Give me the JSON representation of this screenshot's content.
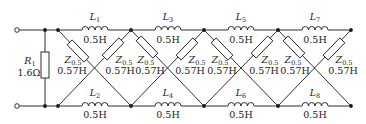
{
  "diagram": {
    "type": "ladder-lattice-circuit",
    "resistor": {
      "name": "R",
      "sub": "1",
      "value": "1.6Ω"
    },
    "inductors": [
      {
        "name": "L",
        "sub": "1",
        "value": "0.5H"
      },
      {
        "name": "L",
        "sub": "2",
        "value": "0.5H"
      },
      {
        "name": "L",
        "sub": "3",
        "value": "0.5H"
      },
      {
        "name": "L",
        "sub": "4",
        "value": "0.5H"
      },
      {
        "name": "L",
        "sub": "5",
        "value": "0.5H"
      },
      {
        "name": "L",
        "sub": "6",
        "value": "0.5H"
      },
      {
        "name": "L",
        "sub": "7",
        "value": "0.5H"
      },
      {
        "name": "L",
        "sub": "8",
        "value": "0.5H"
      }
    ],
    "impedances": [
      {
        "name": "Z",
        "sub": "0.5",
        "value": "0.57H"
      },
      {
        "name": "Z",
        "sub": "0.5",
        "value": "0.57H"
      },
      {
        "name": "Z",
        "sub": "0.5",
        "value": "0.57H"
      },
      {
        "name": "Z",
        "sub": "0.5",
        "value": "0.57H"
      },
      {
        "name": "Z",
        "sub": "0.5",
        "value": "0.57H"
      },
      {
        "name": "Z",
        "sub": "0.5",
        "value": "0.57H"
      },
      {
        "name": "Z",
        "sub": "0.5",
        "value": "0.57H"
      },
      {
        "name": "Z",
        "sub": "0.5",
        "value": "0.57H"
      }
    ],
    "colors": {
      "line": "#1a1a1a",
      "background": "#ffffff"
    }
  }
}
